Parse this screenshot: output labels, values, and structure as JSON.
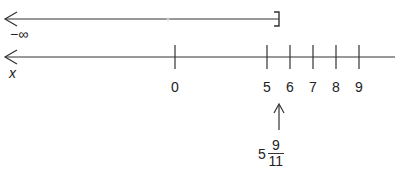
{
  "top_line": {
    "left_label": "−∞",
    "left_end": "open-arrow",
    "right_end": "closed-bracket",
    "right_bracket_glyph": "]"
  },
  "bottom_line": {
    "variable_label": "x",
    "ticks": [
      {
        "value": "0",
        "x": 175
      },
      {
        "value": "5",
        "x": 267
      },
      {
        "value": "6",
        "x": 290
      },
      {
        "value": "7",
        "x": 313
      },
      {
        "value": "8",
        "x": 336
      },
      {
        "value": "9",
        "x": 359
      }
    ]
  },
  "marker": {
    "whole": "5",
    "numerator": "9",
    "denominator": "11"
  },
  "colors": {
    "line": "#333333",
    "text": "#222222",
    "background": "#ffffff"
  }
}
